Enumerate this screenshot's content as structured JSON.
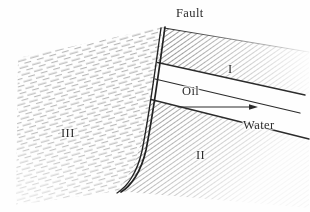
{
  "figure": {
    "ink_color": "#2b2b2b",
    "light_ink_color": "#9a9a9a",
    "paper_color": "#fefefe"
  },
  "labels": {
    "fault": "Fault",
    "oil": "Oil",
    "water": "Water",
    "region_one": "I",
    "region_two": "II",
    "region_three": "III"
  },
  "regions": [
    {
      "id": "I",
      "label": "I",
      "fill": "dense-diagonal-hatch",
      "hatch_color": "#3a3a3a",
      "description": "Upper dipping bed right of the fault, above the oil wedge"
    },
    {
      "id": "II",
      "label": "II",
      "fill": "dense-diagonal-hatch",
      "hatch_color": "#3a3a3a",
      "description": "Lower dipping bed right of the fault, below the water band"
    },
    {
      "id": "III",
      "label": "III",
      "fill": "light-broken-hatch",
      "hatch_color": "#9a9a9a",
      "description": "Downthrown block left of the fault, gently dipping"
    }
  ],
  "features": {
    "fault_line": {
      "name": "Fault",
      "style": "double-line-curve",
      "description": "Curved double line from top center to lower left"
    },
    "oil_wedge": {
      "name": "Oil",
      "fill": "white",
      "description": "Unhatched wedge pinching out against the fault"
    },
    "water_band": {
      "name": "Water",
      "fill": "white",
      "description": "Unhatched band below the oil-water contact"
    },
    "arrow": {
      "name": "oil-water-contact-arrow",
      "direction": "right",
      "x1": 178,
      "y1": 107,
      "x2": 257,
      "y2": 107
    }
  }
}
